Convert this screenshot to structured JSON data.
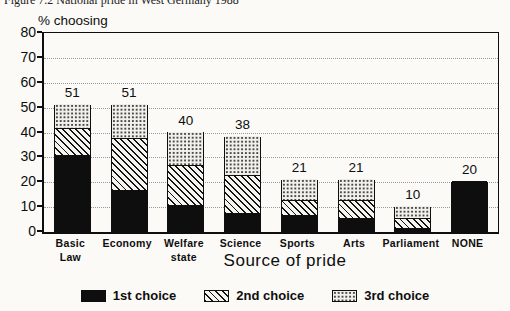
{
  "caption": "Figure 7.2  National pride in West Germany 1988",
  "chart_data": {
    "type": "bar",
    "stacked": true,
    "title": "Figure 7.2  National pride in West Germany 1988",
    "ylabel": "% choosing",
    "xlabel": "Source of pride",
    "ylim": [
      0,
      80
    ],
    "ytick_step": 10,
    "yticks": [
      0,
      10,
      20,
      30,
      40,
      50,
      60,
      70,
      80
    ],
    "grid": true,
    "legend_position": "bottom",
    "categories": [
      "Basic\nLaw",
      "Economy",
      "Welfare\nstate",
      "Science",
      "Sports",
      "Arts",
      "Parliament",
      "NONE"
    ],
    "totals": [
      51,
      51,
      40,
      38,
      21,
      21,
      10,
      20
    ],
    "series": [
      {
        "name": "1st choice",
        "pattern": "solid-black",
        "values": [
          30,
          16,
          10,
          7,
          6,
          5,
          1,
          20
        ]
      },
      {
        "name": "2nd choice",
        "pattern": "diagonal-hatch",
        "values": [
          11,
          21,
          16,
          15,
          6,
          7,
          4,
          0
        ]
      },
      {
        "name": "3rd choice",
        "pattern": "dots",
        "values": [
          10,
          14,
          14,
          16,
          9,
          9,
          5,
          0
        ]
      }
    ],
    "colors": {
      "ink": "#0e0e0e",
      "background": "#fbfaf7",
      "gridline": "#999999"
    }
  },
  "legend": {
    "items": [
      {
        "label": "1st choice",
        "pattern": "solid-black"
      },
      {
        "label": "2nd choice",
        "pattern": "diagonal-hatch"
      },
      {
        "label": "3rd choice",
        "pattern": "dots"
      }
    ]
  }
}
